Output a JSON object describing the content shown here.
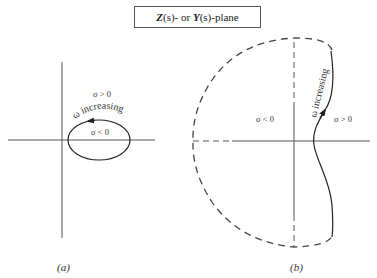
{
  "title": {
    "z_symbol": "Z",
    "z_suffix": "(s)- or ",
    "y_symbol": "Y",
    "y_suffix": "(s)-plane"
  },
  "panel_a": {
    "caption": "(a)",
    "label_sigma_pos": "σ > 0",
    "label_sigma_neg": "σ < 0",
    "label_omega": "ω increasing",
    "contour": "closed ellipse, counter-clockwise arrow at top"
  },
  "panel_b": {
    "caption": "(b)",
    "label_sigma_neg": "σ < 0",
    "label_sigma_pos": "σ > 0",
    "label_omega": "ω increasing",
    "contour": "solid wavy boundary on right; dashed arc enclosing left region"
  },
  "colors": {
    "line": "#333333",
    "dashed": "#444444",
    "axis": "#555555"
  }
}
